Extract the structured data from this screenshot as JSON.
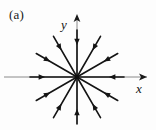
{
  "figure": {
    "panel_label": "(a)",
    "kind": "phase-portrait",
    "background_color": "#fdfdfd",
    "stroke_color": "#141414",
    "axis_color": "#6f6f6f",
    "width": 156,
    "height": 130
  },
  "axes": {
    "x_label": "x",
    "y_label": "y",
    "origin": {
      "x": 77,
      "y": 77
    },
    "x_axis": {
      "x1": 4,
      "y1": 77,
      "x2": 147,
      "y2": 77,
      "arrow_at": "positive"
    },
    "y_axis": {
      "x1": 77,
      "y1": 124,
      "x2": 77,
      "y2": 14,
      "arrow_at": "positive"
    }
  },
  "chart_data": {
    "type": "scatter",
    "title": "(a)",
    "xlabel": "x",
    "ylabel": "y",
    "grid": false,
    "legend": null,
    "xlim": [
      -77,
      79
    ],
    "ylim": [
      -53,
      63
    ],
    "field_type": "radial-inward",
    "ray_count": 12,
    "ray_angle_step_deg": 30,
    "rays": [
      {
        "angle_deg": 0,
        "length": 47,
        "arrow_frac": 0.68,
        "direction": "inward"
      },
      {
        "angle_deg": 30,
        "length": 47,
        "arrow_frac": 0.66,
        "direction": "inward"
      },
      {
        "angle_deg": 60,
        "length": 47,
        "arrow_frac": 0.66,
        "direction": "inward"
      },
      {
        "angle_deg": 90,
        "length": 47,
        "arrow_frac": 0.68,
        "direction": "inward"
      },
      {
        "angle_deg": 120,
        "length": 47,
        "arrow_frac": 0.66,
        "direction": "inward"
      },
      {
        "angle_deg": 150,
        "length": 47,
        "arrow_frac": 0.66,
        "direction": "inward"
      },
      {
        "angle_deg": 180,
        "length": 47,
        "arrow_frac": 0.68,
        "direction": "inward"
      },
      {
        "angle_deg": 210,
        "length": 47,
        "arrow_frac": 0.66,
        "direction": "inward"
      },
      {
        "angle_deg": 240,
        "length": 47,
        "arrow_frac": 0.66,
        "direction": "inward"
      },
      {
        "angle_deg": 270,
        "length": 47,
        "arrow_frac": 0.68,
        "direction": "inward"
      },
      {
        "angle_deg": 300,
        "length": 47,
        "arrow_frac": 0.66,
        "direction": "inward"
      },
      {
        "angle_deg": 330,
        "length": 47,
        "arrow_frac": 0.66,
        "direction": "inward"
      }
    ]
  }
}
